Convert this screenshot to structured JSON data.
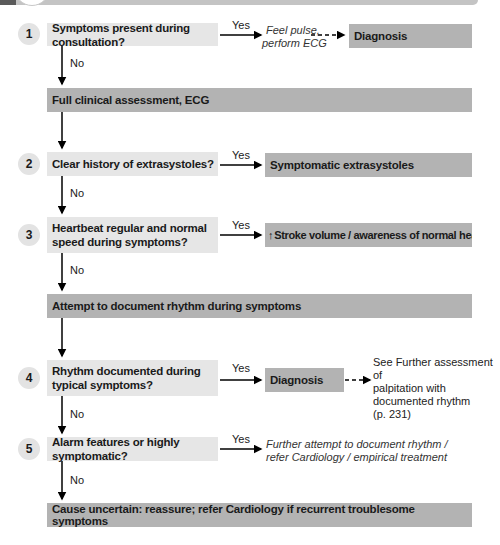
{
  "flowchart": {
    "steps": [
      {
        "number": "1",
        "question": "Symptoms present during consultation?",
        "yes_label": "Yes",
        "yes_action": "Feel pulse, perform ECG",
        "yes_outcome": "Diagnosis",
        "no_label": "No"
      },
      {
        "number": "2",
        "question": "Clear history of extrasystoles?",
        "yes_label": "Yes",
        "yes_outcome": "Symptomatic extrasystoles",
        "no_label": "No"
      },
      {
        "number": "3",
        "question": "Heartbeat regular and normal speed during symptoms?",
        "question_line1": "Heartbeat regular and normal",
        "question_line2": "speed during symptoms?",
        "yes_label": "Yes",
        "yes_outcome_arrow": "↑",
        "yes_outcome": "Stroke volume / awareness of normal heartbeat",
        "no_label": "No"
      },
      {
        "number": "4",
        "question": "Rhythm documented during typical symptoms?",
        "question_line1": "Rhythm documented during",
        "question_line2": "typical symptoms?",
        "yes_label": "Yes",
        "yes_outcome": "Diagnosis",
        "reference_line1": "See Further assessment of",
        "reference_line2": "palpitation with",
        "reference_line3": "documented rhythm",
        "reference_line4": "(p. 231)",
        "no_label": "No"
      },
      {
        "number": "5",
        "question": "Alarm features or highly symptomatic?",
        "yes_label": "Yes",
        "yes_action_line1": "Further attempt to document rhythm /",
        "yes_action_line2": "refer Cardiology / empirical treatment",
        "no_label": "No"
      }
    ],
    "full_assessment": "Full clinical assessment, ECG",
    "attempt_document": "Attempt to document rhythm during symptoms",
    "final_outcome": "Cause uncertain: reassure; refer Cardiology if recurrent troublesome symptoms",
    "action_1_line1": "Feel pulse,",
    "action_1_line2": "perform ECG"
  },
  "colors": {
    "question_fill": "#e6e6e6",
    "outcome_fill": "#b3b3b3",
    "number_circle": "#e3e3e3",
    "arrow": "#000000"
  }
}
